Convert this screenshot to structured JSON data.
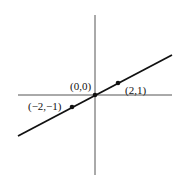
{
  "diagram": {
    "title_partial": "",
    "axes": {
      "x_axis": "horizontal axis",
      "y_axis": "vertical axis"
    },
    "line": {
      "equation_hint": "y = x/2",
      "color": "#111111"
    },
    "points": [
      {
        "label": "(0,0)",
        "x": 0,
        "y": 0
      },
      {
        "label": "(2,1)",
        "x": 2,
        "y": 1
      },
      {
        "label": "(-2,-1)",
        "x": -2,
        "y": -1
      }
    ],
    "labels": {
      "origin": "(0,0)",
      "p1": "(2,1)",
      "p2": "(−2,−1)"
    }
  }
}
